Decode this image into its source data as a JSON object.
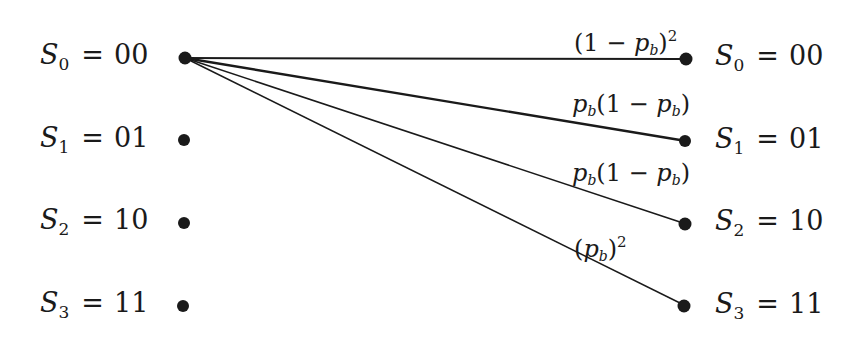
{
  "diagram": {
    "type": "trellis-transition",
    "left_states": [
      {
        "symbol": "S",
        "index": "0",
        "value": "00"
      },
      {
        "symbol": "S",
        "index": "1",
        "value": "01"
      },
      {
        "symbol": "S",
        "index": "2",
        "value": "10"
      },
      {
        "symbol": "S",
        "index": "3",
        "value": "11"
      }
    ],
    "right_states": [
      {
        "symbol": "S",
        "index": "0",
        "value": "00"
      },
      {
        "symbol": "S",
        "index": "1",
        "value": "01"
      },
      {
        "symbol": "S",
        "index": "2",
        "value": "10"
      },
      {
        "symbol": "S",
        "index": "3",
        "value": "11"
      }
    ],
    "transitions": [
      {
        "from": "S0",
        "to": "S0",
        "label": "(1 − p_b)^2",
        "parts": {
          "pre": "(1 − ",
          "var": "p",
          "sub": "b",
          "post": ")",
          "sup": "2"
        }
      },
      {
        "from": "S0",
        "to": "S1",
        "label": "p_b(1 − p_b)",
        "parts": {
          "var1": "p",
          "sub1": "b",
          "mid": "(1 − ",
          "var2": "p",
          "sub2": "b",
          "post": ")"
        }
      },
      {
        "from": "S0",
        "to": "S2",
        "label": "p_b(1 − p_b)",
        "parts": {
          "var1": "p",
          "sub1": "b",
          "mid": "(1 − ",
          "var2": "p",
          "sub2": "b",
          "post": ")"
        }
      },
      {
        "from": "S0",
        "to": "S3",
        "label": "(p_b)^2",
        "parts": {
          "pre": "(",
          "var": "p",
          "sub": "b",
          "post": ")",
          "sup": "2"
        }
      }
    ],
    "equals": "="
  }
}
